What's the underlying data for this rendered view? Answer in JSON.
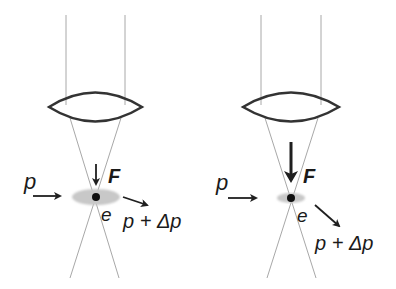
{
  "colors": {
    "line": "#a8a8a8",
    "lens": "#333333",
    "arrow": "#1f1f1f",
    "halo": "#c8c8c8",
    "dot": "#111111"
  },
  "panels": [
    {
      "id": "left",
      "labels": {
        "momentum_in": "p",
        "force": "F",
        "electron": "e",
        "momentum_out": "p + Δp"
      },
      "force_strength": "weak",
      "scatter": "small"
    },
    {
      "id": "right",
      "labels": {
        "momentum_in": "p",
        "force": "F",
        "electron": "e",
        "momentum_out": "p + Δp"
      },
      "force_strength": "strong",
      "scatter": "large"
    }
  ]
}
